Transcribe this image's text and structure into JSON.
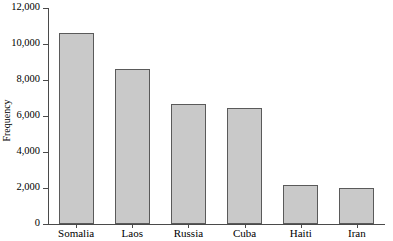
{
  "chart_data": {
    "type": "bar",
    "title": "",
    "subtitle": "",
    "xlabel": "",
    "ylabel": "Frequency",
    "categories": [
      "Somalia",
      "Laos",
      "Russia",
      "Cuba",
      "Haiti",
      "Iran"
    ],
    "values": [
      10600,
      8600,
      6650,
      6450,
      2150,
      2000
    ],
    "ylim": [
      0,
      12000
    ],
    "yticks": [
      0,
      2000,
      4000,
      6000,
      8000,
      10000,
      12000
    ],
    "ytick_labels": [
      "0",
      "2,000",
      "4,000",
      "6,000",
      "8,000",
      "10,000",
      "12,000"
    ],
    "grid": false,
    "legend": false,
    "legend_position": "none",
    "bar_fill_color": "#c9c9c9",
    "bar_edge_color": "#5a5a5a",
    "axis_color": "#4a4a4a",
    "background_color": "#ffffff"
  }
}
